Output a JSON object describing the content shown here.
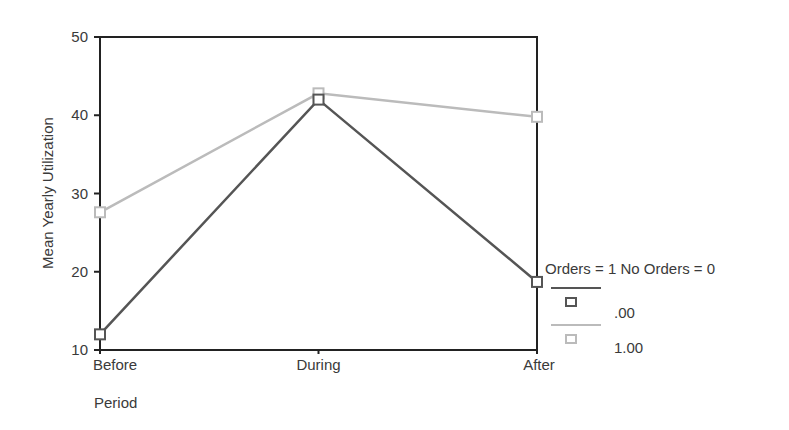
{
  "chart_data": {
    "type": "line",
    "title": "",
    "xlabel": "Period",
    "ylabel": "Mean Yearly Utilization",
    "categories": [
      "Before",
      "During",
      "After"
    ],
    "ylim": [
      10,
      50
    ],
    "yticks": [
      "10",
      "20",
      "30",
      "40",
      "50"
    ],
    "grid": false,
    "legend_position": "right",
    "legend_title": "Orders = 1 No Orders = 0",
    "series": [
      {
        "name": ".00",
        "values": [
          12.0,
          42.0,
          18.7
        ],
        "color": "#555555"
      },
      {
        "name": "1.00",
        "values": [
          27.6,
          42.8,
          39.8
        ],
        "color": "#bbbbbb"
      }
    ]
  }
}
